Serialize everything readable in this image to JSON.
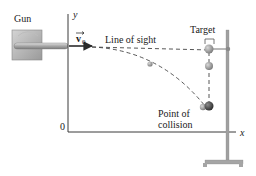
{
  "labels": {
    "gun": "Gun",
    "velocity_vector": "v",
    "velocity_subscript": "0",
    "line_of_sight": "Line of sight",
    "target": "Target",
    "point_of_collision_line1": "Point of",
    "point_of_collision_line2": "collision",
    "y_axis": "y",
    "x_axis": "x",
    "origin": "0"
  },
  "colors": {
    "axis": "#3a3a3a",
    "dashed_path": "#444444",
    "gun_body": "#b8b8b8",
    "barrel": "#9a9a9a",
    "arrow": "#2b2b2b",
    "target_ball": "#8a8a8a",
    "projectile_ball": "#3d3d3d",
    "stand": "#9c9c9c"
  }
}
